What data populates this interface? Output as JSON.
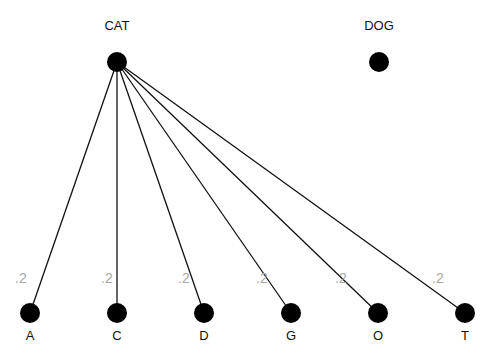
{
  "diagram": {
    "type": "bipartite-graph",
    "colors": {
      "node": "#000000",
      "edge": "#111111",
      "node_label": "#111111",
      "edge_label": "#a8a8a8",
      "background": "#ffffff"
    },
    "top_nodes": [
      {
        "id": "CAT",
        "label": "CAT",
        "x": 117,
        "y": 62
      },
      {
        "id": "DOG",
        "label": "DOG",
        "x": 379,
        "y": 62
      }
    ],
    "bottom_nodes": [
      {
        "id": "A",
        "label": "A",
        "x": 30,
        "y": 313
      },
      {
        "id": "C",
        "label": "C",
        "x": 117,
        "y": 313
      },
      {
        "id": "D",
        "label": "D",
        "x": 204,
        "y": 313
      },
      {
        "id": "G",
        "label": "G",
        "x": 291,
        "y": 313
      },
      {
        "id": "O",
        "label": "O",
        "x": 378,
        "y": 313
      },
      {
        "id": "T",
        "label": "T",
        "x": 465,
        "y": 313
      }
    ],
    "edges": [
      {
        "from": "CAT",
        "to": "A",
        "weight": ".2",
        "lx": 15,
        "ly": 283
      },
      {
        "from": "CAT",
        "to": "C",
        "weight": ".2",
        "lx": 101,
        "ly": 283
      },
      {
        "from": "CAT",
        "to": "D",
        "weight": ".2",
        "lx": 178,
        "ly": 283
      },
      {
        "from": "CAT",
        "to": "G",
        "weight": ".2",
        "lx": 256,
        "ly": 283
      },
      {
        "from": "CAT",
        "to": "O",
        "weight": ".2",
        "lx": 335,
        "ly": 283
      },
      {
        "from": "CAT",
        "to": "T",
        "weight": ".2",
        "lx": 432,
        "ly": 283
      }
    ]
  }
}
